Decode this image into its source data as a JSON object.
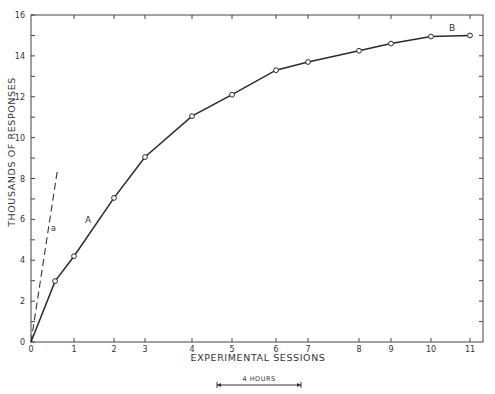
{
  "chart_data": {
    "type": "line",
    "title": "",
    "xlabel": "EXPERIMENTAL SESSIONS",
    "ylabel": "THOUSANDS OF RESPONSES",
    "xlim": [
      0,
      11
    ],
    "ylim": [
      0,
      16
    ],
    "x_ticks": [
      "0",
      "1",
      "2",
      "3",
      "4",
      "5",
      "6",
      "7",
      "8",
      "9",
      "10",
      "11"
    ],
    "x_tick_px": [
      31,
      74,
      114,
      145,
      192,
      232,
      276,
      308,
      359,
      391,
      431,
      470
    ],
    "y_ticks": [
      "0",
      "2",
      "4",
      "6",
      "8",
      "10",
      "12",
      "14",
      "16"
    ],
    "y_tick_values": [
      0,
      2,
      4,
      6,
      8,
      10,
      12,
      14,
      16
    ],
    "grid": false,
    "series": [
      {
        "name": "A",
        "style": "solid",
        "markers": "open-circle",
        "x": [
          0,
          0.56,
          1,
          2,
          3,
          4,
          5,
          6,
          7,
          8,
          9,
          10,
          11
        ],
        "values": [
          0,
          2.98,
          4.2,
          7.05,
          9.05,
          11.05,
          12.1,
          13.3,
          13.7,
          14.25,
          14.6,
          14.95,
          15.0
        ],
        "marker_from_index": 1
      },
      {
        "name": "a",
        "style": "dashed",
        "markers": "none",
        "x": [
          0,
          0.62
        ],
        "values": [
          0,
          8.5
        ]
      }
    ],
    "annotations": [
      {
        "text": "A",
        "x": 1.3,
        "y": 6.0
      },
      {
        "text": "a",
        "x": 0.5,
        "y": 5.6
      },
      {
        "text": "B",
        "x": 10.55,
        "y": 15.35
      },
      {
        "text": "4 HOURS",
        "type": "scale-bar",
        "x_start_px": 217,
        "x_end_px": 301
      }
    ],
    "legend": null
  },
  "labels": {
    "xlabel": "EXPERIMENTAL SESSIONS",
    "ylabel": "THOUSANDS OF RESPONSES",
    "curve_A": "A",
    "curve_a": "a",
    "curve_B": "B",
    "scale_bar": "4 HOURS"
  }
}
